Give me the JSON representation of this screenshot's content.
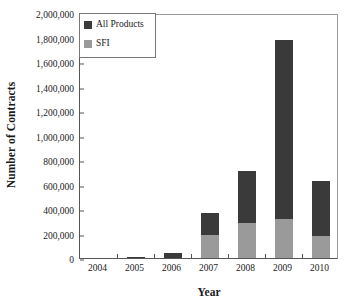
{
  "chart_data": {
    "type": "bar",
    "title": "",
    "subtitle": "",
    "xlabel": "Year",
    "ylabel": "Number of Contracts",
    "categories": [
      "2004",
      "2005",
      "2006",
      "2007",
      "2008",
      "2009",
      "2010"
    ],
    "ylim": [
      0,
      2000000
    ],
    "yticks": [
      0,
      200000,
      400000,
      600000,
      800000,
      1000000,
      1200000,
      1400000,
      1600000,
      1800000,
      2000000
    ],
    "ytick_labels": [
      "0",
      "200,000",
      "400,000",
      "600,000",
      "800,000",
      "1,000,000",
      "1,200,000",
      "1,400,000",
      "1,600,000",
      "1,800,000",
      "2,000,000"
    ],
    "grid": false,
    "stacked": true,
    "legend_position": "top-left",
    "series": [
      {
        "name": "All Products",
        "color": "#3a3a3a",
        "values": [
          0,
          10000,
          40000,
          367000,
          710000,
          1780000,
          630000
        ]
      },
      {
        "name": "SFI",
        "color": "#9a9a9a",
        "values": [
          0,
          0,
          0,
          188000,
          286000,
          318000,
          180000
        ]
      }
    ]
  },
  "legend": {
    "items": [
      {
        "label": "All Products",
        "color": "#3a3a3a"
      },
      {
        "label": "SFI",
        "color": "#9a9a9a"
      }
    ]
  },
  "axes": {
    "x_title": "Year",
    "y_title": "Number of Contracts"
  }
}
